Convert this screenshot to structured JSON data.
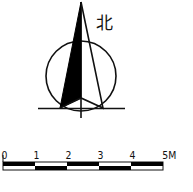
{
  "north_arrow": {
    "label": "北",
    "colors": {
      "stroke": "#111111",
      "fill": "#000000",
      "background": "#ffffff"
    }
  },
  "scale_bar": {
    "labels": [
      "0",
      "1",
      "2",
      "3",
      "4",
      "5M"
    ],
    "unit": "M",
    "segments": 5
  }
}
